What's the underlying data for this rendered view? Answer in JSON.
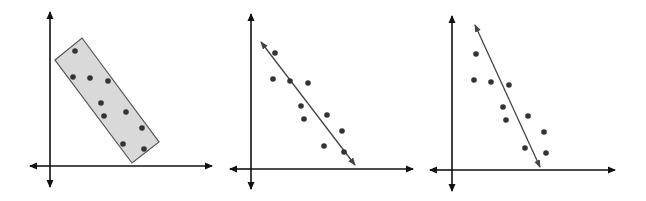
{
  "figure": {
    "colors": {
      "axis": "#111111",
      "point": "#333333",
      "line": "#444444",
      "band_fill": "#d9d9d9",
      "band_stroke": "#555555"
    }
  },
  "panels": [
    {
      "name": "enclosed-band",
      "axes": {
        "y_axis_x": 50,
        "y_top": 12,
        "y_bottom": 187,
        "x_axis_y": 166,
        "x_left": 30,
        "x_right": 212
      },
      "band": [
        [
          55,
          60
        ],
        [
          82,
          38
        ],
        [
          159,
          142
        ],
        [
          132,
          163
        ]
      ],
      "points": [
        [
          75,
          51
        ],
        [
          73,
          77
        ],
        [
          90,
          78
        ],
        [
          108,
          81
        ],
        [
          101,
          103
        ],
        [
          104,
          116
        ],
        [
          126,
          112
        ],
        [
          142,
          128
        ],
        [
          123,
          144
        ],
        [
          144,
          149
        ]
      ]
    },
    {
      "name": "good-fit-line",
      "axes": {
        "y_axis_x": 251,
        "y_top": 14,
        "y_bottom": 189,
        "x_axis_y": 169,
        "x_left": 230,
        "x_right": 413
      },
      "line": [
        [
          261,
          42
        ],
        [
          355,
          165
        ]
      ],
      "points": [
        [
          275,
          53
        ],
        [
          273,
          79
        ],
        [
          290,
          81
        ],
        [
          308,
          83
        ],
        [
          301,
          106
        ],
        [
          304,
          119
        ],
        [
          327,
          115
        ],
        [
          342,
          131
        ],
        [
          324,
          146
        ],
        [
          344,
          152
        ]
      ]
    },
    {
      "name": "poor-fit-line",
      "axes": {
        "y_axis_x": 452,
        "y_top": 16,
        "y_bottom": 191,
        "x_axis_y": 170,
        "x_left": 430,
        "x_right": 615
      },
      "line": [
        [
          475,
          25
        ],
        [
          540,
          167
        ]
      ],
      "points": [
        [
          476,
          54
        ],
        [
          474,
          80
        ],
        [
          491,
          82
        ],
        [
          509,
          85
        ],
        [
          503,
          107
        ],
        [
          506,
          120
        ],
        [
          528,
          116
        ],
        [
          544,
          132
        ],
        [
          525,
          148
        ],
        [
          546,
          153
        ]
      ]
    }
  ]
}
